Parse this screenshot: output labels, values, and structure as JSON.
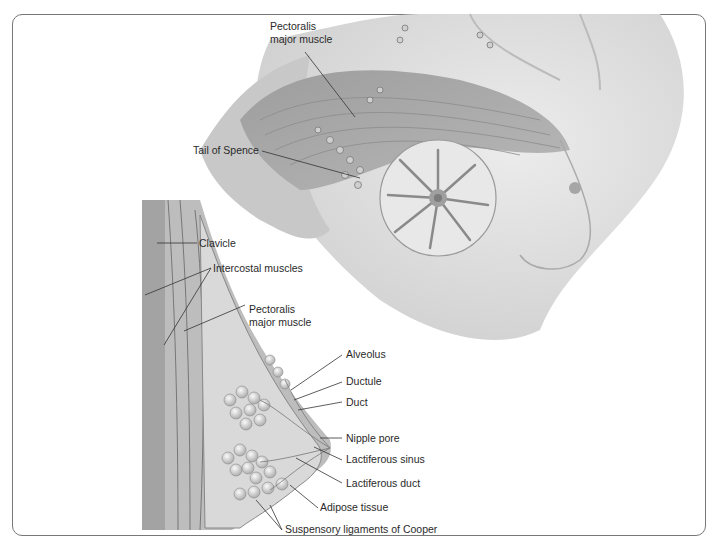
{
  "figure": {
    "type": "anatomical-illustration",
    "palette": {
      "skin": "#e2e2e2",
      "muscle": "#a9a9a9",
      "tissue": "#d0d0d0",
      "line": "#333333",
      "border": "#777777"
    }
  },
  "labels": {
    "pectoralis_top_1": "Pectoralis",
    "pectoralis_top_2": "major muscle",
    "tail_of_spence": "Tail of Spence",
    "clavicle": "Clavicle",
    "intercostal": "Intercostal muscles",
    "pectoralis_side_1": "Pectoralis",
    "pectoralis_side_2": "major muscle",
    "alveolus": "Alveolus",
    "ductule": "Ductule",
    "duct": "Duct",
    "nipple_pore": "Nipple pore",
    "lactiferous_sinus": "Lactiferous sinus",
    "lactiferous_duct": "Lactiferous duct",
    "adipose": "Adipose tissue",
    "cooper": "Suspensory ligaments of Cooper"
  }
}
